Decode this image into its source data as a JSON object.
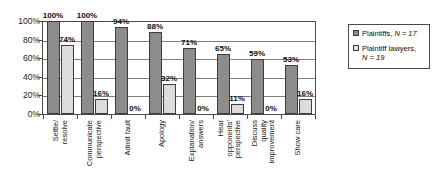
{
  "chart_data": {
    "type": "bar",
    "title": "",
    "xlabel": "",
    "ylabel": "",
    "ylim": [
      0,
      100
    ],
    "ytick_labels": [
      "100%",
      "80%",
      "60%",
      "40%",
      "20%",
      "0%"
    ],
    "ytick_values": [
      100,
      80,
      60,
      40,
      20,
      0
    ],
    "grid": true,
    "legend_position": "right",
    "categories": [
      "Settle/ resolve",
      "Communicate perspective",
      "Admit fault",
      "Apology",
      "Explanation/ answers",
      "Hear opponents' perspective",
      "Discuss quality improvement",
      "Show care"
    ],
    "category_lines": [
      [
        "Settle/",
        "resolve"
      ],
      [
        "Communicate",
        "perspective"
      ],
      [
        "Admit fault"
      ],
      [
        "Apology"
      ],
      [
        "Explanation/",
        "answers"
      ],
      [
        "Hear",
        "opponents'",
        "perspective"
      ],
      [
        "Discuss",
        "quality",
        "improvement"
      ],
      [
        "Show care"
      ]
    ],
    "series": [
      {
        "name": "Plaintiffs, N = 17",
        "key": "plaintiffs",
        "color": "#8c8c8c",
        "values": [
          100,
          100,
          94,
          88,
          71,
          65,
          59,
          53
        ],
        "labels": [
          "100%",
          "100%",
          "94%",
          "88%",
          "71%",
          "65%",
          "59%",
          "53%"
        ]
      },
      {
        "name": "Plaintiff lawyers, N = 19",
        "key": "plaintiff_lawyers",
        "color": "#dcdcdc",
        "values": [
          74,
          16,
          0,
          32,
          0,
          11,
          0,
          16
        ],
        "labels": [
          "74%",
          "16%",
          "0%",
          "32%",
          "0%",
          "11%",
          "0%",
          "16%"
        ]
      }
    ]
  },
  "legend": {
    "entries": [
      {
        "label_line1": "Plaintiffs, ",
        "n_label": "N",
        "n_value": " = 17",
        "label_line2": ""
      },
      {
        "label_line1": "Plaintiff lawyers, ",
        "n_label": "N",
        "n_value": " = 19",
        "label_line2": "N = 19"
      }
    ],
    "series_a_text": "Plaintiffs, ",
    "series_a_n": "N = 17",
    "series_b_text": "Plaintiff lawyers,",
    "series_b_n": "N = 19"
  },
  "colors": {
    "series_a": "#8c8c8c",
    "series_b": "#dcdcdc",
    "axis": "#4a4a4a",
    "grid": "#7e7e7e",
    "text": "#0d0d0d"
  }
}
